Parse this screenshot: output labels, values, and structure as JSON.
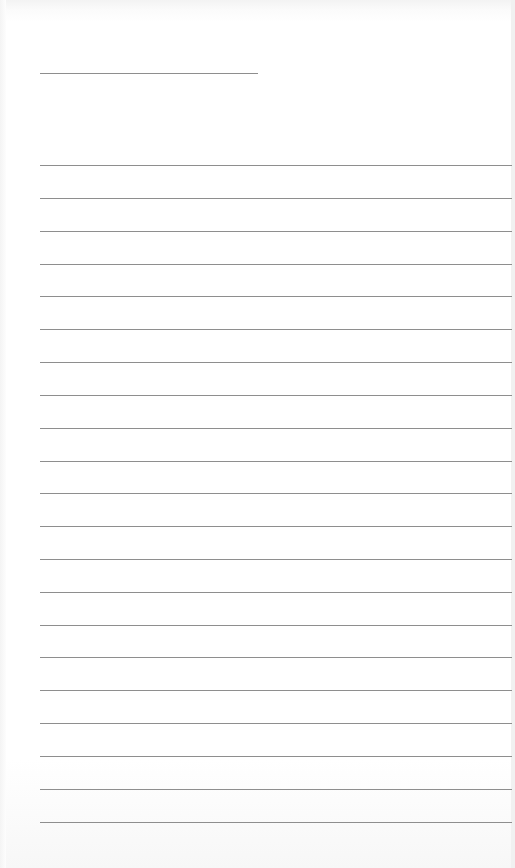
{
  "document": {
    "type": "lined-paper",
    "background_color": "#ffffff",
    "line_color": "#8e8e8e",
    "title_line": {
      "x_start": 40,
      "x_end": 258,
      "y": 73
    },
    "ruled_lines": {
      "x_start": 40,
      "x_end": 512,
      "count": 21,
      "y_positions": [
        165,
        198,
        231,
        264,
        296,
        329,
        362,
        395,
        428,
        461,
        493,
        526,
        559,
        592,
        625,
        657,
        690,
        723,
        756,
        789,
        822
      ]
    },
    "text_content": []
  }
}
